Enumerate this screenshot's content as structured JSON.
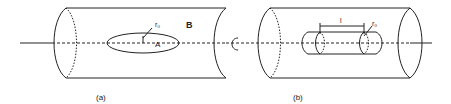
{
  "panels": [
    {
      "id": "a",
      "caption": "(a)",
      "region_label": "B",
      "inner_label": "A",
      "radius_label": "r₀",
      "inner_shape": "ellipse"
    },
    {
      "id": "b",
      "caption": "(b)",
      "length_label": "l",
      "radius_label": "r₀",
      "inner_shape": "capsule-cylinder"
    }
  ],
  "rotation_symbol": "rotation-arrow",
  "colors": {
    "stroke": "#222222",
    "background": "#ffffff"
  }
}
